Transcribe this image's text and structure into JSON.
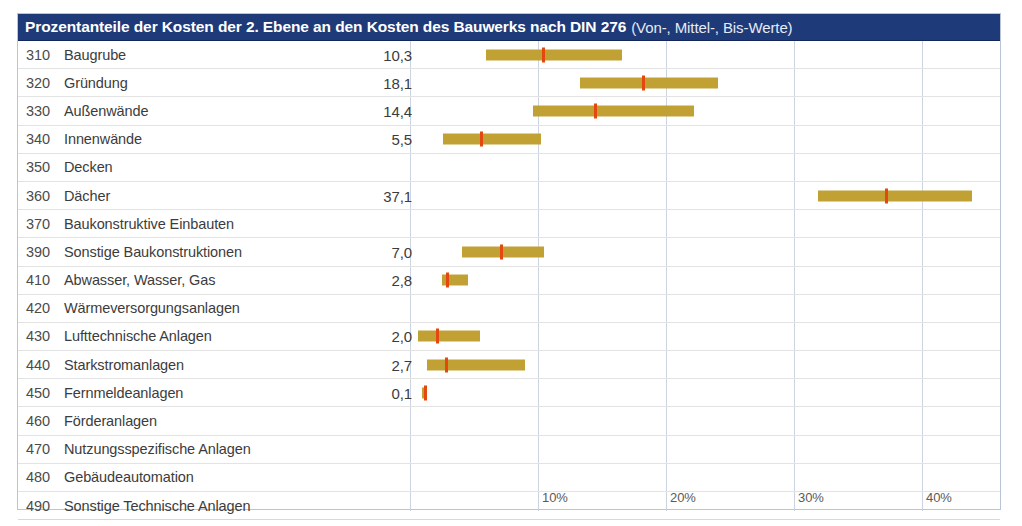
{
  "header": {
    "title_main": "Prozentanteile der Kosten der 2. Ebene an den Kosten des Bauwerks nach DIN 276",
    "title_sub": "(Von-, Mittel-, Bis-Werte)",
    "band_color": "#1e3a78",
    "band_text_color": "#ffffff"
  },
  "columns": {
    "code": "",
    "label": "",
    "value": ""
  },
  "colors": {
    "bar": "#c1a134",
    "marker": "#e3490f",
    "gridline": "#ccd4e2",
    "rowline": "#e3e3e3",
    "frame": "#b9c4d4"
  },
  "chart_data": {
    "type": "bar",
    "title": "Prozentanteile der Kosten der 2. Ebene an den Kosten des Bauwerks nach DIN 276 (Von-, Mittel-, Bis-Werte)",
    "xlabel": "",
    "ylabel": "",
    "xlim": [
      0,
      45
    ],
    "xticks": [
      10,
      20,
      30,
      40
    ],
    "xtick_labels": [
      "10%",
      "20%",
      "30%",
      "40%"
    ],
    "grid": true,
    "legend": null,
    "value_label_note": "Mittel-Wert (mean) shown in numeric column; bar spans Von- to Bis-Wert; red marker = Mittel-Wert",
    "rows": [
      {
        "code": "310",
        "label": "Baugrube",
        "value": "10,3",
        "von": 5.9,
        "mittel": 10.3,
        "bis": 16.6
      },
      {
        "code": "320",
        "label": "Gründung",
        "value": "18,1",
        "von": 13.3,
        "mittel": 18.1,
        "bis": 24.1
      },
      {
        "code": "330",
        "label": "Außenwände",
        "value": "14,4",
        "von": 9.6,
        "mittel": 14.4,
        "bis": 22.2
      },
      {
        "code": "340",
        "label": "Innenwände",
        "value": "5,5",
        "von": 2.6,
        "mittel": 5.5,
        "bis": 10.2
      },
      {
        "code": "350",
        "label": "Decken",
        "value": "",
        "von": null,
        "mittel": null,
        "bis": null
      },
      {
        "code": "360",
        "label": "Dächer",
        "value": "37,1",
        "von": 31.9,
        "mittel": 37.1,
        "bis": 43.9
      },
      {
        "code": "370",
        "label": "Baukonstruktive Einbauten",
        "value": "",
        "von": null,
        "mittel": null,
        "bis": null
      },
      {
        "code": "390",
        "label": "Sonstige Baukonstruktionen",
        "value": "7,0",
        "von": 4.1,
        "mittel": 7.0,
        "bis": 10.5
      },
      {
        "code": "410",
        "label": "Abwasser, Wasser, Gas",
        "value": "2,8",
        "von": 2.5,
        "mittel": 2.8,
        "bis": 4.5
      },
      {
        "code": "420",
        "label": "Wärmeversorgungsanlagen",
        "value": "",
        "von": null,
        "mittel": null,
        "bis": null
      },
      {
        "code": "430",
        "label": "Lufttechnische Anlagen",
        "value": "2,0",
        "von": 0.6,
        "mittel": 2.0,
        "bis": 5.5
      },
      {
        "code": "440",
        "label": "Starkstromanlagen",
        "value": "2,7",
        "von": 1.3,
        "mittel": 2.7,
        "bis": 9.0
      },
      {
        "code": "450",
        "label": "Fernmeldeanlagen",
        "value": "0,1",
        "von": 0.9,
        "mittel": 1.1,
        "bis": 1.3
      },
      {
        "code": "460",
        "label": "Förderanlagen",
        "value": "",
        "von": null,
        "mittel": null,
        "bis": null
      },
      {
        "code": "470",
        "label": "Nutzungsspezifische Anlagen",
        "value": "",
        "von": null,
        "mittel": null,
        "bis": null
      },
      {
        "code": "480",
        "label": "Gebäudeautomation",
        "value": "",
        "von": null,
        "mittel": null,
        "bis": null
      },
      {
        "code": "490",
        "label": "Sonstige Technische Anlagen",
        "value": "",
        "von": null,
        "mittel": null,
        "bis": null
      }
    ]
  }
}
